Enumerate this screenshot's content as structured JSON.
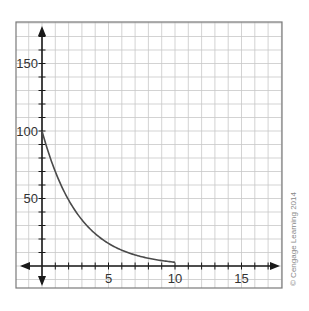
{
  "chart_data": {
    "type": "line",
    "title": "",
    "xlabel": "",
    "ylabel": "",
    "xlim": [
      -2,
      18
    ],
    "ylim": [
      -13,
      180
    ],
    "grid": true,
    "x_ticks": [
      5,
      10,
      15
    ],
    "x_tick_labels": [
      "5",
      "10",
      "15"
    ],
    "y_ticks": [
      50,
      100,
      150
    ],
    "y_tick_labels": [
      "50",
      "100",
      "150"
    ],
    "x_minor_step": 1,
    "y_minor_step": 10,
    "series": [
      {
        "name": "decay curve",
        "x": [
          0,
          1,
          2,
          3,
          4,
          5,
          6,
          7,
          8,
          9,
          10
        ],
        "values": [
          100,
          70,
          49,
          34.3,
          24,
          16.8,
          11.8,
          8.2,
          5.8,
          4.0,
          2.8
        ]
      }
    ],
    "annotations": [
      "© Cengage Learning 2014"
    ]
  },
  "credit": "© Cengage Learning 2014",
  "colors": {
    "grid": "#c8c8c8",
    "frame": "#7a7a7a",
    "axis": "#1a1a1a",
    "curve": "#4a4a4a"
  }
}
